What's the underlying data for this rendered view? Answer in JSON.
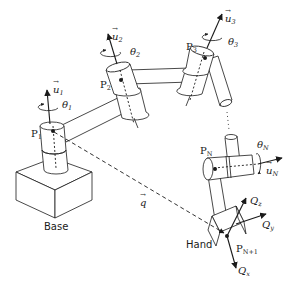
{
  "diagram": {
    "base": {
      "label": "Base"
    },
    "joints": [
      {
        "point": "P",
        "point_sub": "1",
        "axis": "u",
        "axis_sub": "1",
        "angle": "θ",
        "angle_sub": "1"
      },
      {
        "point": "P",
        "point_sub": "2",
        "axis": "u",
        "axis_sub": "2",
        "angle": "θ",
        "angle_sub": "2"
      },
      {
        "point": "P",
        "point_sub": "3",
        "axis": "u",
        "axis_sub": "3",
        "angle": "θ",
        "angle_sub": "3"
      },
      {
        "point": "P",
        "point_sub": "N",
        "axis": "u",
        "axis_sub": "N",
        "angle": "θ",
        "angle_sub": "N"
      }
    ],
    "hand": {
      "label": "Hand",
      "point": "P",
      "point_sub": "N+1",
      "frame": [
        {
          "name": "Q",
          "sub": "x"
        },
        {
          "name": "Q",
          "sub": "y"
        },
        {
          "name": "Q",
          "sub": "z"
        }
      ]
    },
    "position_vector": {
      "label": "q"
    },
    "vector_mark": "→"
  }
}
